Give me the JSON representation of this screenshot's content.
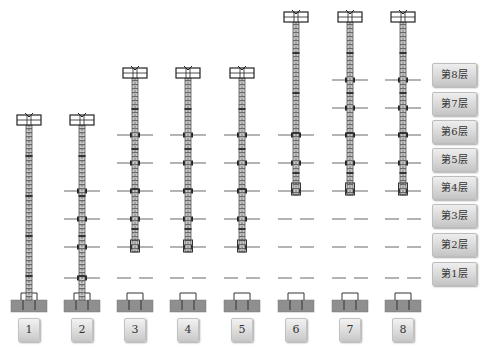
{
  "diagram": {
    "type": "construction-sequence",
    "stage_labels": [
      "1",
      "2",
      "3",
      "4",
      "5",
      "6",
      "7",
      "8"
    ],
    "floor_labels": [
      "第8层",
      "第7层",
      "第6层",
      "第5层",
      "第4层",
      "第3层",
      "第2层",
      "第1层"
    ],
    "colors": {
      "mast": "#555555",
      "mast_fill": "#bdbdbd",
      "floor_slab": "#8a8a8a",
      "foundation": "#8f8f8f",
      "label_bg": "#d8d8d8"
    }
  },
  "stages": [
    {
      "label": "1",
      "mast_top_y": 115,
      "mast_bottom_y": 300,
      "floors_shown": 0
    },
    {
      "label": "2",
      "mast_top_y": 115,
      "mast_bottom_y": 300,
      "floors_shown": 4
    },
    {
      "label": "3",
      "mast_top_y": 68,
      "mast_bottom_y": 252,
      "floors_shown": 6
    },
    {
      "label": "4",
      "mast_top_y": 68,
      "mast_bottom_y": 252,
      "floors_shown": 6
    },
    {
      "label": "5",
      "mast_top_y": 68,
      "mast_bottom_y": 252,
      "floors_shown": 6
    },
    {
      "label": "6",
      "mast_top_y": 12,
      "mast_bottom_y": 195,
      "floors_shown": 6
    },
    {
      "label": "7",
      "mast_top_y": 12,
      "mast_bottom_y": 195,
      "floors_shown": 8
    },
    {
      "label": "8",
      "mast_top_y": 12,
      "mast_bottom_y": 195,
      "floors_shown": 8
    }
  ]
}
